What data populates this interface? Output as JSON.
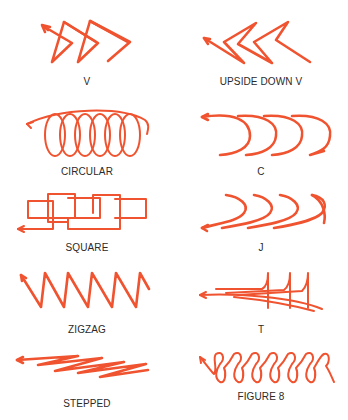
{
  "figure": {
    "accent_color": "#f0532f",
    "label_color": "#2a2a2a",
    "patterns": [
      {
        "id": "v",
        "label": "V",
        "icon": "v-pattern-icon"
      },
      {
        "id": "upside-down-v",
        "label": "UPSIDE DOWN V",
        "icon": "upside-down-v-pattern-icon"
      },
      {
        "id": "circular",
        "label": "CIRCULAR",
        "icon": "circular-pattern-icon"
      },
      {
        "id": "c",
        "label": "C",
        "icon": "c-pattern-icon"
      },
      {
        "id": "square",
        "label": "SQUARE",
        "icon": "square-pattern-icon"
      },
      {
        "id": "j",
        "label": "J",
        "icon": "j-pattern-icon"
      },
      {
        "id": "zigzag",
        "label": "ZIGZAG",
        "icon": "zigzag-pattern-icon"
      },
      {
        "id": "t",
        "label": "T",
        "icon": "t-pattern-icon"
      },
      {
        "id": "stepped",
        "label": "STEPPED",
        "icon": "stepped-pattern-icon"
      },
      {
        "id": "figure-8",
        "label": "FIGURE 8",
        "icon": "figure-8-pattern-icon"
      }
    ]
  }
}
